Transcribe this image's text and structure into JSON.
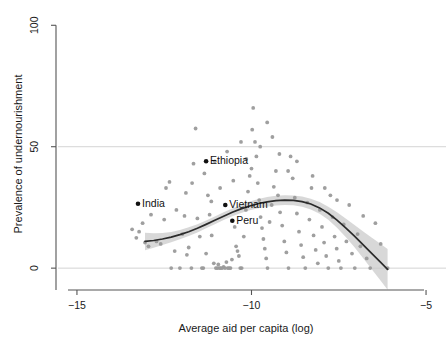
{
  "chart_data": {
    "type": "scatter",
    "title": "",
    "xlabel": "Average aid per capita (log)",
    "ylabel": "Prevalence of undernourishment",
    "xlim": [
      -15.6,
      -4.6
    ],
    "ylim": [
      -9,
      103
    ],
    "xticks": [
      -15,
      -10,
      -5
    ],
    "xticklabels": [
      "−15",
      "−10",
      "−5"
    ],
    "yticks": [
      0,
      50,
      100
    ],
    "yticklabels": [
      "0",
      "50",
      "100"
    ],
    "grid": "horizontal gridlines at y=0 and y=50",
    "legend": "none",
    "point_color": "#9a9a9a",
    "highlight_color": "#111111",
    "curve_color": "#2b2b2b",
    "ribbon_color": "#c9c9c9",
    "axis_color": "#555555",
    "gridline_color": "#cfcfcf",
    "annotations": [
      {
        "label": "India",
        "x": -13.25,
        "y": 26.5
      },
      {
        "label": "Ethiopia",
        "x": -11.3,
        "y": 44.0
      },
      {
        "label": "Vietnam",
        "x": -10.75,
        "y": 26.0
      },
      {
        "label": "Peru",
        "x": -10.55,
        "y": 19.5
      }
    ],
    "smooth_curve": {
      "name": "loess",
      "x": [
        -13.05,
        -12.8,
        -12.55,
        -12.3,
        -12.05,
        -11.8,
        -11.55,
        -11.3,
        -11.05,
        -10.8,
        -10.55,
        -10.3,
        -10.05,
        -9.8,
        -9.55,
        -9.3,
        -9.05,
        -8.8,
        -8.55,
        -8.3,
        -8.05,
        -7.8,
        -7.55,
        -7.3,
        -7.05,
        -6.8,
        -6.55,
        -6.3,
        -6.1
      ],
      "y": [
        11.0,
        11.4,
        12.0,
        12.8,
        13.8,
        15.0,
        16.4,
        18.0,
        19.7,
        21.4,
        23.0,
        24.4,
        25.6,
        26.6,
        27.3,
        27.8,
        28.0,
        27.9,
        27.4,
        26.4,
        24.8,
        22.6,
        19.8,
        16.6,
        13.2,
        9.6,
        6.0,
        2.4,
        -0.5
      ],
      "ci_halfwidth": [
        3.6,
        3.0,
        2.5,
        2.1,
        1.9,
        1.8,
        1.7,
        1.6,
        1.6,
        1.6,
        1.6,
        1.7,
        1.8,
        1.9,
        2.0,
        2.0,
        2.0,
        2.0,
        2.1,
        2.2,
        2.4,
        2.7,
        3.2,
        3.8,
        4.6,
        5.5,
        6.5,
        7.6,
        8.4
      ]
    },
    "points": [
      [
        -13.42,
        16.0
      ],
      [
        -13.3,
        12.5
      ],
      [
        -13.22,
        15.0
      ],
      [
        -13.05,
        10.5
      ],
      [
        -12.95,
        9.0
      ],
      [
        -12.72,
        11.0
      ],
      [
        -12.6,
        10.0
      ],
      [
        -12.45,
        33.0
      ],
      [
        -12.35,
        35.5
      ],
      [
        -12.3,
        0.0
      ],
      [
        -12.05,
        0.0
      ],
      [
        -11.98,
        14.0
      ],
      [
        -11.92,
        21.5
      ],
      [
        -11.85,
        5.5
      ],
      [
        -11.8,
        8.5
      ],
      [
        -11.72,
        0.0
      ],
      [
        -11.66,
        43.0
      ],
      [
        -11.6,
        57.5
      ],
      [
        -11.55,
        20.5
      ],
      [
        -11.48,
        13.0
      ],
      [
        -11.42,
        0.0
      ],
      [
        -11.38,
        0.0
      ],
      [
        -11.3,
        6.0
      ],
      [
        -11.25,
        30.0
      ],
      [
        -11.2,
        22.0
      ],
      [
        -11.14,
        13.5
      ],
      [
        -11.08,
        2.0
      ],
      [
        -11.02,
        0.0
      ],
      [
        -10.98,
        0.0
      ],
      [
        -10.95,
        1.5
      ],
      [
        -10.92,
        0.0
      ],
      [
        -10.88,
        0.0
      ],
      [
        -10.84,
        0.0
      ],
      [
        -10.8,
        0.5
      ],
      [
        -10.76,
        0.0
      ],
      [
        -10.72,
        2.5
      ],
      [
        -10.68,
        0.0
      ],
      [
        -10.64,
        0.0
      ],
      [
        -10.6,
        0.0
      ],
      [
        -10.56,
        3.5
      ],
      [
        -10.52,
        36.0
      ],
      [
        -10.48,
        17.0
      ],
      [
        -10.44,
        9.0
      ],
      [
        -10.4,
        7.0
      ],
      [
        -10.36,
        5.0
      ],
      [
        -10.32,
        0.0
      ],
      [
        -10.28,
        0.0
      ],
      [
        -10.22,
        13.0
      ],
      [
        -10.16,
        24.0
      ],
      [
        -10.1,
        31.5
      ],
      [
        -10.05,
        38.0
      ],
      [
        -10.0,
        41.0
      ],
      [
        -9.95,
        66.0
      ],
      [
        -9.9,
        52.0
      ],
      [
        -9.86,
        46.0
      ],
      [
        -9.82,
        35.0
      ],
      [
        -9.78,
        28.0
      ],
      [
        -9.74,
        21.0
      ],
      [
        -9.7,
        16.5
      ],
      [
        -9.66,
        12.0
      ],
      [
        -9.62,
        8.0
      ],
      [
        -9.58,
        4.0
      ],
      [
        -9.54,
        0.0
      ],
      [
        -9.48,
        19.0
      ],
      [
        -9.42,
        26.0
      ],
      [
        -9.36,
        33.5
      ],
      [
        -9.3,
        40.0
      ],
      [
        -9.24,
        30.0
      ],
      [
        -9.18,
        23.0
      ],
      [
        -9.12,
        17.5
      ],
      [
        -9.06,
        11.0
      ],
      [
        -9.0,
        6.5
      ],
      [
        -8.94,
        0.0
      ],
      [
        -8.88,
        46.0
      ],
      [
        -8.82,
        37.0
      ],
      [
        -8.76,
        29.0
      ],
      [
        -8.7,
        22.5
      ],
      [
        -8.64,
        15.0
      ],
      [
        -8.58,
        9.5
      ],
      [
        -8.52,
        4.5
      ],
      [
        -8.46,
        0.0
      ],
      [
        -8.4,
        27.0
      ],
      [
        -8.34,
        20.0
      ],
      [
        -8.28,
        33.0
      ],
      [
        -8.22,
        13.5
      ],
      [
        -8.16,
        7.5
      ],
      [
        -8.1,
        2.0
      ],
      [
        -8.04,
        24.0
      ],
      [
        -7.98,
        17.0
      ],
      [
        -7.92,
        10.5
      ],
      [
        -7.86,
        5.0
      ],
      [
        -7.8,
        0.0
      ],
      [
        -7.74,
        30.0
      ],
      [
        -7.68,
        21.0
      ],
      [
        -7.62,
        13.0
      ],
      [
        -7.56,
        8.0
      ],
      [
        -7.5,
        3.0
      ],
      [
        -7.44,
        0.0
      ],
      [
        -7.36,
        18.0
      ],
      [
        -7.28,
        11.0
      ],
      [
        -7.2,
        26.0
      ],
      [
        -7.12,
        6.0
      ],
      [
        -7.04,
        0.0
      ],
      [
        -6.96,
        14.0
      ],
      [
        -6.88,
        9.0
      ],
      [
        -6.8,
        21.5
      ],
      [
        -6.7,
        4.0
      ],
      [
        -6.6,
        0.0
      ],
      [
        -6.45,
        18.5
      ],
      [
        -6.3,
        10.0
      ],
      [
        -6.1,
        0.0
      ],
      [
        -12.15,
        24.0
      ],
      [
        -11.88,
        31.0
      ],
      [
        -11.05,
        44.0
      ],
      [
        -10.7,
        48.0
      ],
      [
        -10.3,
        52.0
      ],
      [
        -9.98,
        57.0
      ],
      [
        -9.55,
        60.0
      ],
      [
        -9.2,
        47.0
      ],
      [
        -8.95,
        40.0
      ],
      [
        -12.5,
        20.0
      ],
      [
        -12.2,
        7.0
      ],
      [
        -11.7,
        35.0
      ],
      [
        -11.35,
        39.0
      ],
      [
        -10.9,
        33.0
      ],
      [
        -10.15,
        45.0
      ],
      [
        -9.75,
        50.0
      ],
      [
        -9.4,
        54.0
      ],
      [
        -8.7,
        44.0
      ],
      [
        -8.25,
        38.0
      ],
      [
        -7.9,
        33.0
      ],
      [
        -7.55,
        28.0
      ],
      [
        -13.12,
        18.5
      ],
      [
        -12.88,
        22.0
      ],
      [
        -11.15,
        27.5
      ]
    ]
  },
  "geometry": {
    "plot_left": 56,
    "plot_right": 440,
    "plot_top": 18,
    "plot_bottom": 290,
    "x_axis_start": 68,
    "x_axis_end": 424
  }
}
